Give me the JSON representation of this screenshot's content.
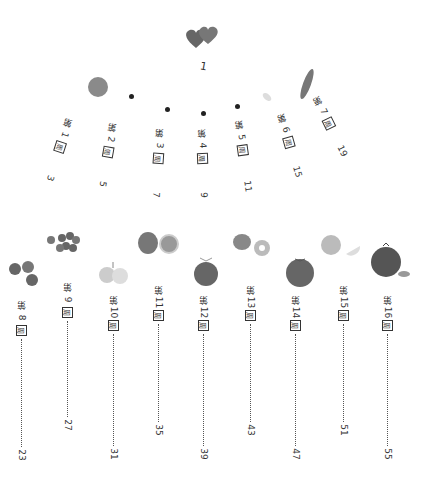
{
  "title": "1",
  "week_prefix": "第",
  "week_suffix": "周",
  "entries_top": [
    {
      "week": "1",
      "page": "3"
    },
    {
      "week": "2",
      "page": "5"
    },
    {
      "week": "3",
      "page": "7"
    },
    {
      "week": "4",
      "page": "9"
    },
    {
      "week": "5",
      "page": "11"
    },
    {
      "week": "6",
      "page": "15"
    },
    {
      "week": "7",
      "page": "19"
    }
  ],
  "entries_bottom": [
    {
      "week": "8",
      "page": "23"
    },
    {
      "week": "9",
      "page": "27"
    },
    {
      "week": "10",
      "page": "31"
    },
    {
      "week": "11",
      "page": "35"
    },
    {
      "week": "12",
      "page": "39"
    },
    {
      "week": "13",
      "page": "43"
    },
    {
      "week": "14",
      "page": "47"
    },
    {
      "week": "15",
      "page": "51"
    },
    {
      "week": "16",
      "page": "55"
    }
  ],
  "illustrations": [
    "hearts-icon",
    "fruit-plum",
    "seed-dots",
    "pea-pod",
    "blueberries",
    "grapes",
    "pears",
    "figs",
    "tangerine",
    "kiwi",
    "tomato",
    "lemon",
    "pomegranate"
  ]
}
